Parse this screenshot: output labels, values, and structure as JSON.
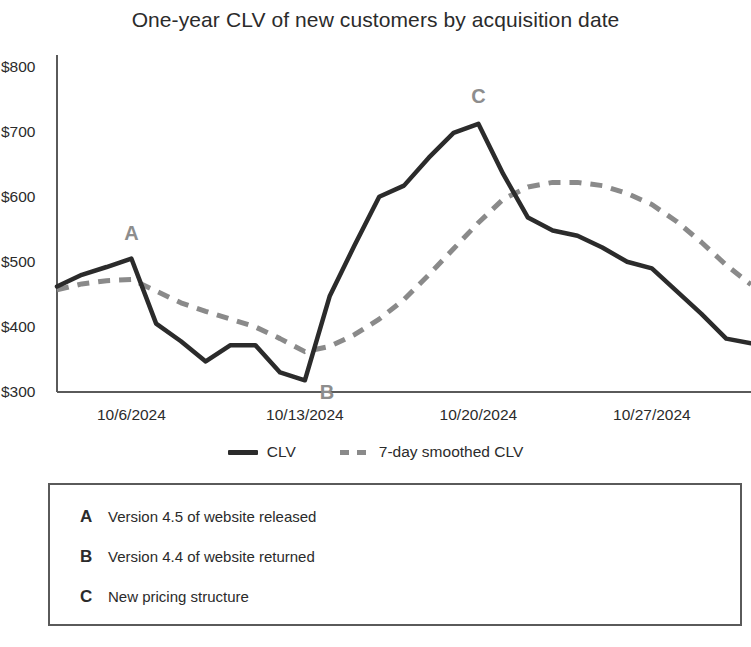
{
  "chart_data": {
    "type": "line",
    "title": "One-year CLV of new customers by acquisition date",
    "xlabel": "",
    "ylabel": "",
    "ylim": [
      300,
      800
    ],
    "yticks": [
      300,
      400,
      500,
      600,
      700,
      800
    ],
    "ytick_labels": [
      "$300",
      "$400",
      "$500",
      "$600",
      "$700",
      "$800"
    ],
    "xtick_labels": [
      "10/6/2024",
      "10/13/2024",
      "10/20/2024",
      "10/27/2024"
    ],
    "xtick_dates": [
      "2024-10-06",
      "2024-10-13",
      "2024-10-20",
      "2024-10-27"
    ],
    "grid": false,
    "legend_position": "bottom",
    "x": [
      "2024-10-03",
      "2024-10-04",
      "2024-10-05",
      "2024-10-06",
      "2024-10-07",
      "2024-10-08",
      "2024-10-09",
      "2024-10-10",
      "2024-10-11",
      "2024-10-12",
      "2024-10-13",
      "2024-10-14",
      "2024-10-15",
      "2024-10-16",
      "2024-10-17",
      "2024-10-18",
      "2024-10-19",
      "2024-10-20",
      "2024-10-21",
      "2024-10-22",
      "2024-10-23",
      "2024-10-24",
      "2024-10-25",
      "2024-10-26",
      "2024-10-27",
      "2024-10-28",
      "2024-10-29",
      "2024-10-30",
      "2024-10-31"
    ],
    "series": [
      {
        "name": "CLV",
        "style": "solid",
        "color": "#2b2b2b",
        "values": [
          462,
          480,
          492,
          505,
          405,
          378,
          347,
          372,
          372,
          330,
          318,
          447,
          525,
          600,
          617,
          660,
          698,
          712,
          635,
          568,
          548,
          540,
          522,
          500,
          490,
          455,
          420,
          382,
          375
        ]
      },
      {
        "name": "7-day smoothed CLV",
        "style": "dashed",
        "color": "#8a8a8a",
        "values": [
          457,
          466,
          471,
          473,
          455,
          437,
          424,
          412,
          400,
          382,
          362,
          370,
          388,
          412,
          442,
          480,
          520,
          560,
          596,
          615,
          622,
          622,
          617,
          605,
          588,
          562,
          530,
          495,
          465
        ]
      }
    ],
    "annotations": [
      {
        "key": "A",
        "x": "2024-10-06",
        "y": 505
      },
      {
        "key": "B",
        "x": "2024-10-13",
        "y": 318
      },
      {
        "key": "C",
        "x": "2024-10-20",
        "y": 712
      }
    ]
  },
  "notes": {
    "items": [
      {
        "key": "A",
        "text": "Version 4.5 of website released"
      },
      {
        "key": "B",
        "text": "Version 4.4 of website returned"
      },
      {
        "key": "C",
        "text": "New pricing structure"
      }
    ]
  },
  "colors": {
    "clv_line": "#2b2b2b",
    "smoothed_line": "#8a8a8a",
    "axis": "#5a5a5a",
    "annotation_label": "#8d8d8d",
    "text": "#2b2b2b"
  }
}
